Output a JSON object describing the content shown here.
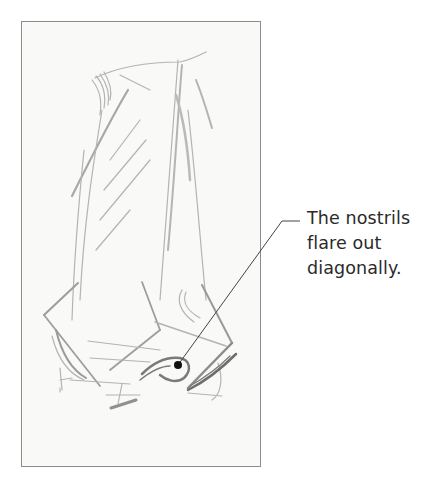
{
  "illustration": {
    "subject": "nose sketch (three-quarter view from below)",
    "style": "pencil drawing"
  },
  "callout": {
    "lines": [
      "The nostrils",
      "flare out",
      "diagonally."
    ],
    "target": "nostril"
  },
  "colors": {
    "frame_border": "#8c8c8c",
    "frame_fill": "#f9f9f8",
    "pencil": "#9a9a9a",
    "pencil_dark": "#6a6a6a",
    "leader_line": "#444444",
    "dot": "#111111",
    "text": "#2a2a2a"
  }
}
